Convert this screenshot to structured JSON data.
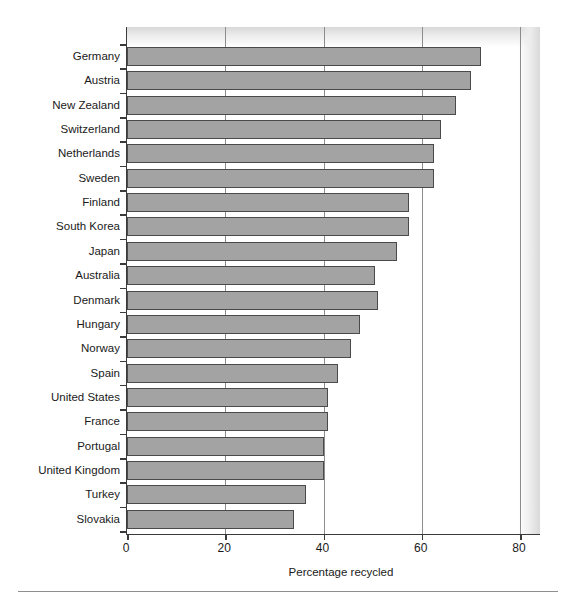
{
  "chart_data": {
    "type": "bar",
    "orientation": "horizontal",
    "title": "",
    "xlabel": "Percentage recycled",
    "ylabel": "",
    "xlim": [
      0,
      84
    ],
    "xticks": [
      0,
      20,
      40,
      60,
      80
    ],
    "xtick_labels": [
      "0",
      "20",
      "40",
      "60",
      "80"
    ],
    "grid": "vertical",
    "legend": "none",
    "bar_color": "#a3a3a3",
    "bar_edge_color": "#4a4a4a",
    "axis_color": "#3a3a3a",
    "gridline_color": "#8c8c8c",
    "categories": [
      "Germany",
      "Austria",
      "New Zealand",
      "Switzerland",
      "Netherlands",
      "Sweden",
      "Finland",
      "South Korea",
      "Japan",
      "Australia",
      "Denmark",
      "Hungary",
      "Norway",
      "Spain",
      "United States",
      "France",
      "Portugal",
      "United Kingdom",
      "Turkey",
      "Slovakia"
    ],
    "values": [
      72,
      70,
      67,
      64,
      62.5,
      62.5,
      57.5,
      57.5,
      55,
      50.5,
      51,
      47.5,
      45.5,
      43,
      41,
      41,
      40,
      40,
      36.5,
      34
    ]
  },
  "axis": {
    "x_title": "Percentage recycled"
  }
}
